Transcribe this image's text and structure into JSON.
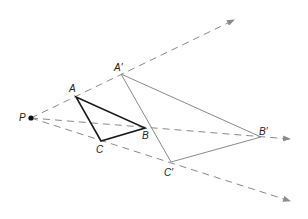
{
  "diagram": {
    "type": "dilation",
    "center": {
      "label": "P",
      "x": 31,
      "y": 118,
      "label_x": 19,
      "label_y": 121
    },
    "original": {
      "color": "#1a1a1a",
      "points": [
        {
          "label": "A",
          "x": 76,
          "y": 97,
          "label_x": 69,
          "label_y": 92
        },
        {
          "label": "B",
          "x": 145,
          "y": 128,
          "label_x": 142,
          "label_y": 139
        },
        {
          "label": "C",
          "x": 101,
          "y": 141,
          "label_x": 96,
          "label_y": 153
        }
      ]
    },
    "image": {
      "color": "#8a8a8a",
      "points": [
        {
          "label": "A′",
          "x": 121,
          "y": 74,
          "label_x": 114,
          "label_y": 71
        },
        {
          "label": "B′",
          "x": 261,
          "y": 137,
          "label_x": 259,
          "label_y": 135
        },
        {
          "label": "C′",
          "x": 171,
          "y": 162,
          "label_x": 164,
          "label_y": 176
        }
      ]
    },
    "rays": {
      "color": "#8a8a8a",
      "dash": "7,5",
      "items": [
        {
          "name": "ray-pa",
          "x2": 234,
          "y2": 20
        },
        {
          "name": "ray-pb",
          "x2": 290,
          "y2": 139
        },
        {
          "name": "ray-pc",
          "x2": 290,
          "y2": 201
        }
      ]
    }
  }
}
